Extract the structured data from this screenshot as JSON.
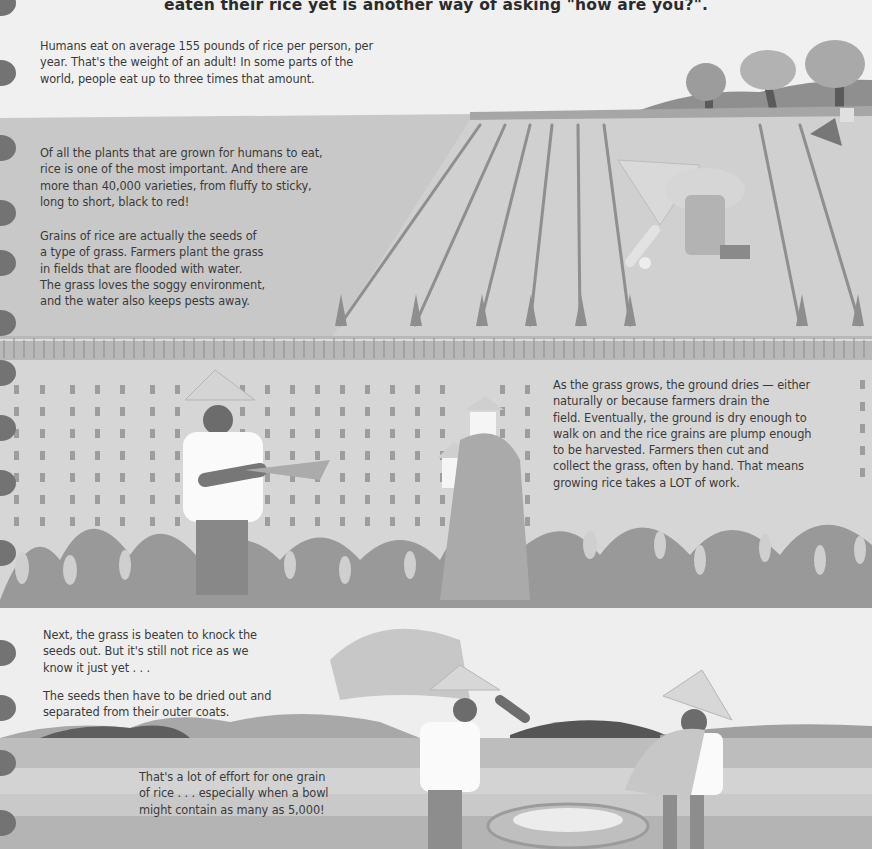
{
  "header": {
    "caption": "eaten their rice yet is another way of asking \"how are you?\"."
  },
  "sections": [
    {
      "id": "consumption",
      "lines": [
        "Humans eat on average 155 pounds of rice per person, per",
        "year. That's the weight of an adult! In some parts of the",
        "world, people eat up to three times that amount."
      ]
    },
    {
      "id": "importance",
      "lines": [
        "Of all the plants that are grown for humans to eat,",
        "rice is one of the most important. And there are",
        "more than 40,000 varieties, from fluffy to sticky,",
        "long to short, black to red!"
      ]
    },
    {
      "id": "grains",
      "lines": [
        "Grains of rice are actually the seeds of",
        "a type of grass. Farmers plant the grass",
        "in fields that are flooded with water.",
        "The grass loves the soggy environment,",
        "and the water also keeps pests away."
      ]
    },
    {
      "id": "harvest",
      "lines": [
        "As the grass grows, the ground dries — either",
        "naturally or because farmers drain the",
        "field. Eventually, the ground is dry enough to",
        "walk on and the rice grains are plump enough",
        "to be harvested. Farmers then cut and",
        "collect the grass, often by hand. That means",
        "growing rice takes a LOT of work."
      ]
    },
    {
      "id": "threshing",
      "lines": [
        "Next, the grass is beaten to knock the",
        "seeds out. But it's still not rice as we",
        "know it just yet . . ."
      ]
    },
    {
      "id": "drying",
      "lines": [
        "The seeds then have to be dried out and",
        "separated from their outer coats."
      ]
    },
    {
      "id": "effort",
      "lines": [
        "That's a lot of effort for one grain",
        "of rice . . . especially when a bowl",
        "might contain as many as 5,000!"
      ]
    }
  ],
  "illustration": {
    "scenes": [
      "planting-paddy-with-farmer",
      "harvesting-rice-field-with-farmers",
      "threshing-rice-with-basket"
    ],
    "palette": {
      "paper": "#f0f0f0",
      "water": "#c6c6c6",
      "field": "#d2d2d2",
      "grass_dark": "#8a8a8a",
      "hill_dark": "#5e5e5e",
      "shirt": "#fbfbfb",
      "skin": "#6e6e6e",
      "hat": "#d8d8d8",
      "spiral": "#737373"
    }
  }
}
